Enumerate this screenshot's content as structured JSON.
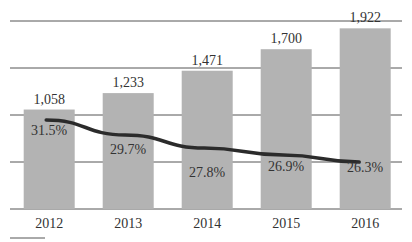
{
  "chart_data": {
    "type": "bar",
    "title": "",
    "xlabel": "",
    "ylabel": "",
    "categories": [
      "2012",
      "2013",
      "2014",
      "2015",
      "2016"
    ],
    "series": [
      {
        "name": "Value",
        "type": "bar",
        "values": [
          1058,
          1233,
          1471,
          1700,
          1922
        ],
        "labels": [
          "1,058",
          "1,233",
          "1,471",
          "1,700",
          "1,922"
        ],
        "color": "#b3b3b3"
      },
      {
        "name": "Percentage",
        "type": "line",
        "values": [
          31.5,
          29.7,
          27.8,
          26.9,
          26.3
        ],
        "labels": [
          "31.5%",
          "29.7%",
          "27.8%",
          "26.9%",
          "26.3%"
        ],
        "color": "#2b2b2b"
      }
    ],
    "ylim": [
      0,
      2000
    ],
    "y_gridlines": [
      0,
      500,
      1000,
      1500,
      2000
    ],
    "grid": true,
    "legend": "none",
    "y_axis_ticks_visible": false
  }
}
